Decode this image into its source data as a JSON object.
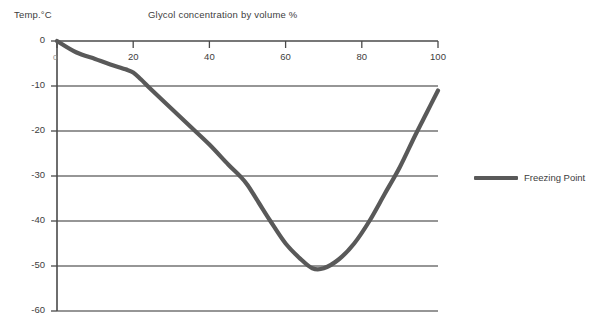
{
  "chart_data": {
    "type": "line",
    "title": "Glycol concentration by volume %",
    "xlabel": "Glycol concentration by volume %",
    "ylabel": "Temp.°C",
    "origin_label": "0",
    "xlim": [
      0,
      100
    ],
    "ylim": [
      -60,
      0
    ],
    "xticks": [
      0,
      20,
      40,
      60,
      80,
      100
    ],
    "xtick_labels": [
      "0",
      "20",
      "40",
      "60",
      "80",
      "100"
    ],
    "yticks": [
      0,
      -10,
      -20,
      -30,
      -40,
      -50,
      -60
    ],
    "ytick_labels": [
      "0",
      "-10",
      "-20",
      "-30",
      "-40",
      "-50",
      "-60"
    ],
    "grid": "horizontal",
    "legend_position": "right",
    "series": [
      {
        "name": "Freezing Point",
        "color": "#595959",
        "x": [
          0,
          5,
          10,
          14,
          18,
          20,
          22,
          25,
          30,
          35,
          40,
          45,
          48,
          50,
          53,
          56,
          60,
          64,
          67,
          70,
          74,
          78,
          82,
          86,
          90,
          94,
          97,
          100
        ],
        "values": [
          0,
          -2.5,
          -4,
          -5.2,
          -6.3,
          -7,
          -8.5,
          -11,
          -15,
          -19,
          -23,
          -27.5,
          -30,
          -32,
          -36,
          -40,
          -45,
          -48.5,
          -50.5,
          -50.5,
          -48.5,
          -45,
          -40,
          -34,
          -28,
          -21,
          -16,
          -11
        ]
      }
    ]
  },
  "legend": {
    "entries": [
      {
        "label": "Freezing Point",
        "color": "#595959"
      }
    ]
  },
  "colors": {
    "series": "#595959",
    "axis": "#4a4a4a",
    "grid": "#2f2f2f",
    "text": "#3d3d3d",
    "background": "#ffffff"
  }
}
